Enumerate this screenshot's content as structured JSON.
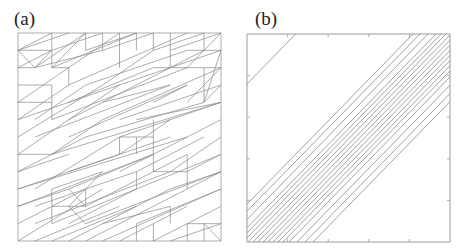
{
  "figure": {
    "panels": [
      {
        "label": "(a)",
        "kind": "triangular-mesh",
        "grid_cells": 12,
        "stroke_color": "#8a8a8a",
        "edges": [
          [
            0,
            0,
            12,
            0
          ],
          [
            12,
            0,
            12,
            12
          ],
          [
            12,
            12,
            0,
            12
          ],
          [
            0,
            12,
            0,
            0
          ],
          [
            0,
            1,
            2,
            0
          ],
          [
            0,
            1,
            2,
            1
          ],
          [
            2,
            0,
            2,
            2
          ],
          [
            0,
            2,
            2,
            1
          ],
          [
            0,
            1,
            1,
            2
          ],
          [
            1,
            2,
            2,
            1
          ],
          [
            0,
            2,
            1,
            2
          ],
          [
            0,
            1,
            3,
            0
          ],
          [
            1,
            2,
            4,
            0
          ],
          [
            2,
            2,
            4,
            0
          ],
          [
            2,
            1,
            5,
            0
          ],
          [
            2,
            2,
            3,
            2
          ],
          [
            3,
            2,
            3,
            3
          ],
          [
            1,
            2,
            5,
            1
          ],
          [
            3,
            2,
            6,
            0
          ],
          [
            4,
            0,
            4,
            1
          ],
          [
            2,
            2,
            7,
            0
          ],
          [
            4,
            1,
            7,
            0
          ],
          [
            5,
            0,
            5,
            1
          ],
          [
            5,
            1,
            8,
            0
          ],
          [
            6,
            0,
            6,
            2
          ],
          [
            5,
            3,
            8,
            1
          ],
          [
            3,
            3,
            10,
            0
          ],
          [
            4,
            3,
            10,
            1
          ],
          [
            7,
            0,
            7,
            1
          ],
          [
            8,
            0,
            8,
            1
          ],
          [
            8,
            1,
            11,
            0
          ],
          [
            9,
            1,
            12,
            0
          ],
          [
            9,
            0,
            9,
            1
          ],
          [
            9,
            1,
            9,
            2
          ],
          [
            10,
            1,
            12,
            1
          ],
          [
            11,
            0,
            11,
            1
          ],
          [
            8,
            2,
            12,
            2
          ],
          [
            9,
            2,
            11,
            1
          ],
          [
            10,
            2,
            12,
            0
          ],
          [
            11,
            4,
            12,
            1
          ],
          [
            10,
            4,
            12,
            2
          ],
          [
            11,
            2,
            11,
            4
          ],
          [
            11,
            4,
            12,
            3
          ],
          [
            0,
            3,
            2,
            3
          ],
          [
            0,
            4,
            3,
            2
          ],
          [
            0,
            5,
            3,
            3
          ],
          [
            0,
            4,
            2,
            4
          ],
          [
            2,
            3,
            2,
            5
          ],
          [
            1,
            5,
            4,
            3
          ],
          [
            0,
            6,
            5,
            3
          ],
          [
            0,
            7,
            6,
            3
          ],
          [
            3,
            4,
            8,
            2
          ],
          [
            3,
            5,
            9,
            2
          ],
          [
            2,
            5,
            10,
            2
          ],
          [
            3,
            6,
            10,
            3
          ],
          [
            5,
            5,
            12,
            2
          ],
          [
            6,
            5,
            12,
            3
          ],
          [
            6,
            6,
            12,
            4
          ],
          [
            4,
            6,
            11,
            4
          ],
          [
            0,
            7,
            2,
            7
          ],
          [
            0,
            8,
            4,
            6
          ],
          [
            0,
            8,
            3,
            7
          ],
          [
            2,
            7,
            5,
            5
          ],
          [
            1,
            9,
            6,
            6
          ],
          [
            0,
            9,
            6,
            7
          ],
          [
            3,
            8,
            9,
            6
          ],
          [
            3,
            9,
            8,
            7
          ],
          [
            6,
            6,
            6,
            7
          ],
          [
            6,
            6,
            8,
            6
          ],
          [
            8,
            6,
            8,
            8
          ],
          [
            7,
            6,
            7,
            7
          ],
          [
            8,
            5,
            8,
            6
          ],
          [
            6,
            7,
            9,
            5
          ],
          [
            7,
            8,
            11,
            6
          ],
          [
            6,
            8,
            12,
            5
          ],
          [
            7,
            8,
            7,
            9
          ],
          [
            8,
            8,
            10,
            8
          ],
          [
            9,
            8,
            12,
            6
          ],
          [
            10,
            8,
            12,
            7
          ],
          [
            10,
            7,
            10,
            9
          ],
          [
            10,
            9,
            12,
            8
          ],
          [
            9,
            9,
            12,
            8
          ],
          [
            0,
            10,
            3,
            9
          ],
          [
            0,
            11,
            4,
            9
          ],
          [
            0,
            12,
            5,
            9
          ],
          [
            2,
            9,
            5,
            8
          ],
          [
            2,
            10,
            4,
            10
          ],
          [
            2,
            10,
            2,
            11
          ],
          [
            3,
            10,
            5,
            8
          ],
          [
            2,
            9,
            2,
            10
          ],
          [
            3,
            10,
            4,
            11
          ],
          [
            4,
            9,
            4,
            10
          ],
          [
            3,
            9,
            4,
            10
          ],
          [
            4,
            10,
            10,
            7
          ],
          [
            4,
            11,
            12,
            8
          ],
          [
            3,
            12,
            9,
            9
          ],
          [
            4,
            12,
            10,
            9
          ],
          [
            5,
            12,
            12,
            9
          ],
          [
            6,
            12,
            10,
            10
          ],
          [
            7,
            11,
            7,
            12
          ],
          [
            8,
            12,
            12,
            10
          ],
          [
            7,
            11,
            12,
            9
          ],
          [
            8,
            11,
            8,
            12
          ],
          [
            9,
            12,
            12,
            11
          ],
          [
            10,
            11,
            12,
            11
          ],
          [
            11,
            11,
            11,
            12
          ],
          [
            11,
            11,
            12,
            12
          ],
          [
            10,
            11,
            10,
            12
          ],
          [
            9,
            10,
            9,
            11
          ],
          [
            5,
            11,
            9,
            10
          ],
          [
            1,
            12,
            6,
            10
          ],
          [
            2,
            12,
            7,
            10
          ],
          [
            0,
            10,
            8,
            7
          ],
          [
            1,
            10,
            7,
            8
          ],
          [
            1,
            11,
            9,
            8
          ],
          [
            3,
            11,
            7,
            9
          ],
          [
            0,
            5,
            12,
            1
          ],
          [
            1,
            6,
            9,
            3
          ],
          [
            2,
            7,
            12,
            4
          ],
          [
            5,
            4,
            9,
            3
          ],
          [
            7,
            5,
            12,
            4
          ],
          [
            8,
            4,
            10,
            3
          ],
          [
            0,
            9,
            10,
            6
          ],
          [
            2,
            11,
            12,
            7
          ]
        ]
      },
      {
        "label": "(b)",
        "kind": "parallel-lines",
        "slope": 1,
        "stroke_color": "#8a8a8a",
        "offsets": [
          0.76,
          0.182,
          0.148,
          0.108,
          0.069,
          0.044,
          0.02,
          -0.005,
          -0.03,
          -0.054,
          -0.079,
          -0.103,
          -0.128,
          -0.153,
          -0.177,
          -0.207,
          -0.246,
          -0.286,
          -0.325
        ],
        "axis_ticks": [
          0.2,
          0.4,
          0.6,
          0.8
        ]
      }
    ]
  }
}
